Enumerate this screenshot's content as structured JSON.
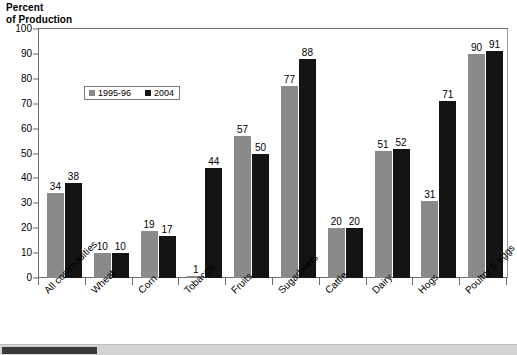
{
  "chart_data": {
    "type": "bar",
    "title": "Percent\nof Production",
    "xlabel": "",
    "ylabel": "Percent of Production",
    "ylim": [
      0,
      100
    ],
    "yticks": [
      0,
      10,
      20,
      30,
      40,
      50,
      60,
      70,
      80,
      90,
      100
    ],
    "grid": false,
    "legend_position": "inside-upper-left",
    "categories": [
      "All commodities",
      "Wheat",
      "Corn",
      "Tobacco",
      "Fruits",
      "Sugarbeets",
      "Cattle",
      "Dairy",
      "Hogs",
      "Poultry & eggs"
    ],
    "series": [
      {
        "name": "1995-96",
        "color": "#8a8a8a",
        "values": [
          34,
          10,
          19,
          1,
          57,
          77,
          20,
          51,
          31,
          90
        ]
      },
      {
        "name": "2004",
        "color": "#141414",
        "values": [
          38,
          10,
          17,
          44,
          50,
          88,
          20,
          52,
          71,
          91
        ]
      }
    ]
  },
  "legend": {
    "items": [
      {
        "label": "1995-96",
        "swatch": "gray-swatch"
      },
      {
        "label": "2004",
        "swatch": "black-swatch"
      }
    ]
  },
  "scrollbar": {
    "orientation": "horizontal",
    "thumb_position": "left"
  }
}
